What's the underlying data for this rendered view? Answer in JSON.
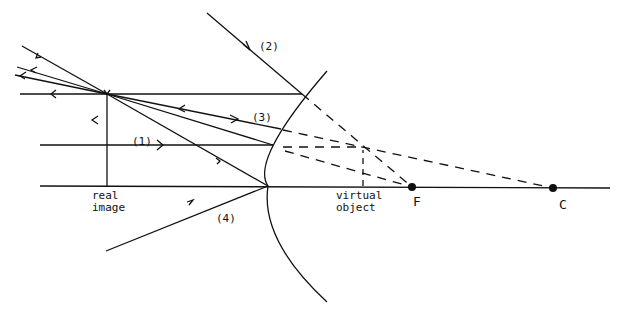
{
  "diagram": {
    "type": "concave mirror ray diagram",
    "colors": {
      "ink": "#111111",
      "background": "#ffffff"
    },
    "ray_labels": [
      "(1)",
      "(2)",
      "(3)",
      "(4)"
    ],
    "labels": {
      "real_image": "real\nimage",
      "virtual_object": "virtual\nobject",
      "focal_point": "F",
      "center": "C"
    },
    "points": {
      "image_tip": [
        107,
        94
      ],
      "image_base": [
        107,
        186
      ],
      "virtual_object_tip": [
        363,
        148
      ],
      "virtual_object_base": [
        363,
        186
      ],
      "F": [
        412,
        187
      ],
      "C": [
        553,
        188
      ],
      "mirror_vertex": [
        268,
        186
      ]
    }
  }
}
